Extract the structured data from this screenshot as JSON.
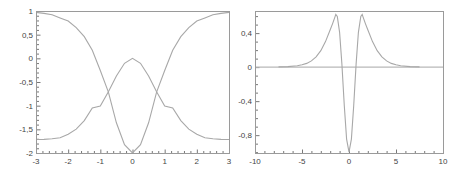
{
  "chart_data": [
    {
      "type": "line",
      "title": "",
      "xlabel": "",
      "ylabel": "",
      "xlim": [
        -3,
        3
      ],
      "ylim": [
        -2,
        1
      ],
      "grid": false,
      "x_ticks": [
        "-3",
        "-2",
        "-1",
        "0",
        "1",
        "2",
        "3"
      ],
      "y_ticks": [
        "1",
        "0,5",
        "0",
        "-0,5",
        "-1",
        "-1,5",
        "-2"
      ],
      "x": [
        -3,
        -2.75,
        -2.5,
        -2.25,
        -2,
        -1.75,
        -1.5,
        -1.25,
        -1,
        -0.75,
        -0.5,
        -0.25,
        0,
        0.25,
        0.5,
        0.75,
        1,
        1.25,
        1.5,
        1.75,
        2,
        2.25,
        2.5,
        2.75,
        3
      ],
      "series": [
        {
          "name": "curve-a",
          "color": "#a8a8a8",
          "values": [
            0.97,
            0.949,
            0.92,
            0.855,
            0.788,
            0.65,
            0.457,
            0.17,
            -0.256,
            -0.714,
            -1.363,
            -1.822,
            -2.0,
            -1.822,
            -1.363,
            -0.714,
            -0.256,
            0.17,
            0.457,
            0.65,
            0.788,
            0.855,
            0.92,
            0.949,
            0.97
          ]
        },
        {
          "name": "curve-b",
          "color": "#a8a8a8",
          "values": [
            -1.715,
            -1.712,
            -1.7,
            -1.678,
            -1.605,
            -1.495,
            -1.316,
            -1.048,
            -1.006,
            -0.706,
            -0.371,
            -0.104,
            0.0,
            -0.104,
            -0.371,
            -0.706,
            -1.006,
            -1.048,
            -1.316,
            -1.495,
            -1.605,
            -1.678,
            -1.7,
            -1.712,
            -1.715
          ]
        }
      ]
    },
    {
      "type": "line",
      "title": "",
      "xlabel": "",
      "ylabel": "",
      "xlim": [
        -10,
        10
      ],
      "ylim": [
        -1.01,
        0.66
      ],
      "grid": false,
      "x_ticks": [
        "-10",
        "-5",
        "0",
        "5",
        "10"
      ],
      "y_ticks": [
        "0,4",
        "0",
        "-0,4",
        "-0,8"
      ],
      "x": [
        -7.5,
        -6.5,
        -5.5,
        -5,
        -4.5,
        -4,
        -3.5,
        -3,
        -2.5,
        -2,
        -1.75,
        -1.5,
        -1.4,
        -1.25,
        -1,
        -0.75,
        -0.5,
        -0.25,
        0,
        0.25,
        0.5,
        0.75,
        1,
        1.25,
        1.4,
        1.5,
        1.75,
        2,
        2.5,
        3,
        3.5,
        4,
        4.5,
        5,
        5.5,
        6.5,
        7.5
      ],
      "series": [
        {
          "name": "curve-c",
          "color": "#a8a8a8",
          "values": [
            0.002,
            0.006,
            0.016,
            0.027,
            0.044,
            0.073,
            0.12,
            0.193,
            0.3,
            0.44,
            0.512,
            0.588,
            0.62,
            0.596,
            0.41,
            0.036,
            -0.454,
            -0.846,
            -1.0,
            -0.846,
            -0.454,
            0.036,
            0.41,
            0.596,
            0.62,
            0.588,
            0.512,
            0.44,
            0.3,
            0.193,
            0.12,
            0.073,
            0.044,
            0.027,
            0.016,
            0.006,
            0.002
          ]
        }
      ],
      "reference_lines": [
        {
          "axis": "y",
          "value": 0,
          "x_range": [
            -10,
            10
          ]
        }
      ]
    }
  ]
}
